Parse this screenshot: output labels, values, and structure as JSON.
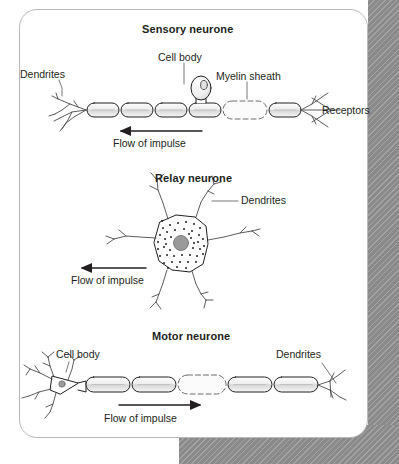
{
  "figure": {
    "background_color": "#ffffff",
    "card_border_color": "#b9b9b9",
    "hatch_color": "#8a8a8a",
    "ink_color": "#231f20"
  },
  "panels": [
    {
      "id": "sensory",
      "title": "Sensory neurone",
      "labels": {
        "dendrites": "Dendrites",
        "cell_body": "Cell body",
        "myelin_sheath": "Myelin sheath",
        "receptors": "Receptors",
        "flow": "Flow of impulse"
      },
      "flow_direction": "left",
      "axon_segments": 6,
      "myelin_highlight_segment": 5
    },
    {
      "id": "relay",
      "title": "Relay neurone",
      "labels": {
        "dendrites": "Dendrites",
        "flow": "Flow of impulse"
      },
      "flow_direction": "left",
      "cell_body_shape": "star-polygon",
      "nucleus_color": "#9a9a9a"
    },
    {
      "id": "motor",
      "title": "Motor neurone",
      "labels": {
        "cell_body": "Cell body",
        "dendrites": "Dendrites",
        "flow": "Flow of impulse"
      },
      "flow_direction": "right",
      "axon_segments": 5,
      "myelin_highlight_segment": 3
    }
  ]
}
